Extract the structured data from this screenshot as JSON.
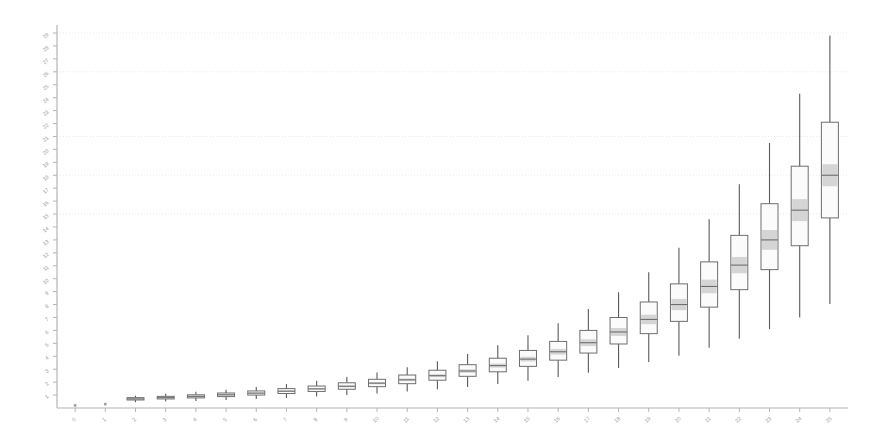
{
  "chart_data": {
    "type": "boxplot",
    "title": "",
    "subtitle": "",
    "xlabel": "",
    "ylabel": "",
    "grid": true,
    "legend": null,
    "background_color": "#ffffff",
    "box_edge_color": "#6e6e6e",
    "box_fill_color": "#fbfbfb",
    "median_band_color": "#b0b0b0",
    "whisker_color": "#5a5a5a",
    "axis_color": "#b4b4b4",
    "grid_color": "#e9e9e9",
    "tick_label_color": "#9a9a9a",
    "xlim": [
      -0.6,
      25.6
    ],
    "ylim": [
      0,
      29
    ],
    "categories": [
      "0",
      "1",
      "2",
      "3",
      "4",
      "5",
      "6",
      "7",
      "8",
      "9",
      "10",
      "11",
      "12",
      "13",
      "14",
      "15",
      "16",
      "17",
      "18",
      "19",
      "20",
      "21",
      "22",
      "23",
      "24",
      "25"
    ],
    "xtick_labels": [
      "0",
      "1",
      "2",
      "3",
      "4",
      "5",
      "6",
      "7",
      "8",
      "9",
      "10",
      "11",
      "12",
      "13",
      "14",
      "15",
      "16",
      "17",
      "18",
      "19",
      "20",
      "21",
      "22",
      "23",
      "24",
      "25"
    ],
    "ytick_labels": [
      "1",
      "2",
      "3",
      "4",
      "5",
      "6",
      "7",
      "8",
      "9",
      "10",
      "11",
      "12",
      "13",
      "14",
      "15",
      "16",
      "17",
      "18",
      "19",
      "20",
      "21",
      "22",
      "23",
      "24",
      "25",
      "26",
      "27",
      "28",
      "29"
    ],
    "ytick_values": [
      1,
      2,
      3,
      4,
      5,
      6,
      7,
      8,
      9,
      10,
      11,
      12,
      13,
      14,
      15,
      16,
      17,
      18,
      19,
      20,
      21,
      22,
      23,
      24,
      25,
      26,
      27,
      28,
      29
    ],
    "gridline_values": [
      29,
      26,
      21,
      18,
      15
    ],
    "boxes": [
      {
        "label": "0",
        "whisker_low": 0.2,
        "q1": 0.2,
        "median": 0.2,
        "q3": 0.2,
        "whisker_high": 0.2
      },
      {
        "label": "1",
        "whisker_low": 0.3,
        "q1": 0.3,
        "median": 0.3,
        "q3": 0.3,
        "whisker_high": 0.3
      },
      {
        "label": "2",
        "whisker_low": 0.45,
        "q1": 0.62,
        "median": 0.7,
        "q3": 0.8,
        "whisker_high": 0.95
      },
      {
        "label": "3",
        "whisker_low": 0.5,
        "q1": 0.7,
        "median": 0.8,
        "q3": 0.9,
        "whisker_high": 1.1
      },
      {
        "label": "4",
        "whisker_low": 0.55,
        "q1": 0.78,
        "median": 0.9,
        "q3": 1.02,
        "whisker_high": 1.25
      },
      {
        "label": "5",
        "whisker_low": 0.62,
        "q1": 0.88,
        "median": 1.02,
        "q3": 1.16,
        "whisker_high": 1.42
      },
      {
        "label": "6",
        "whisker_low": 0.7,
        "q1": 1.0,
        "median": 1.15,
        "q3": 1.32,
        "whisker_high": 1.62
      },
      {
        "label": "7",
        "whisker_low": 0.78,
        "q1": 1.12,
        "median": 1.3,
        "q3": 1.5,
        "whisker_high": 1.85
      },
      {
        "label": "8",
        "whisker_low": 0.88,
        "q1": 1.28,
        "median": 1.48,
        "q3": 1.7,
        "whisker_high": 2.1
      },
      {
        "label": "9",
        "whisker_low": 1.0,
        "q1": 1.45,
        "median": 1.68,
        "q3": 1.95,
        "whisker_high": 2.4
      },
      {
        "label": "10",
        "whisker_low": 1.12,
        "q1": 1.65,
        "median": 1.92,
        "q3": 2.22,
        "whisker_high": 2.75
      },
      {
        "label": "11",
        "whisker_low": 1.28,
        "q1": 1.88,
        "median": 2.18,
        "q3": 2.55,
        "whisker_high": 3.15
      },
      {
        "label": "12",
        "whisker_low": 1.45,
        "q1": 2.15,
        "median": 2.5,
        "q3": 2.92,
        "whisker_high": 3.62
      },
      {
        "label": "13",
        "whisker_low": 1.62,
        "q1": 2.45,
        "median": 2.86,
        "q3": 3.35,
        "whisker_high": 4.18
      },
      {
        "label": "14",
        "whisker_low": 1.85,
        "q1": 2.8,
        "median": 3.28,
        "q3": 3.85,
        "whisker_high": 4.85
      },
      {
        "label": "15",
        "whisker_low": 2.1,
        "q1": 3.22,
        "median": 3.78,
        "q3": 4.45,
        "whisker_high": 5.62
      },
      {
        "label": "16",
        "whisker_low": 2.4,
        "q1": 3.7,
        "median": 4.35,
        "q3": 5.15,
        "whisker_high": 6.55
      },
      {
        "label": "17",
        "whisker_low": 2.72,
        "q1": 4.25,
        "median": 5.05,
        "q3": 6.0,
        "whisker_high": 7.65
      },
      {
        "label": "18",
        "whisker_low": 3.1,
        "q1": 4.95,
        "median": 5.88,
        "q3": 7.0,
        "whisker_high": 8.95
      },
      {
        "label": "19",
        "whisker_low": 3.55,
        "q1": 5.75,
        "median": 6.85,
        "q3": 8.2,
        "whisker_high": 10.5
      },
      {
        "label": "20",
        "whisker_low": 4.05,
        "q1": 6.7,
        "median": 8.0,
        "q3": 9.6,
        "whisker_high": 12.4
      },
      {
        "label": "21",
        "whisker_low": 4.65,
        "q1": 7.8,
        "median": 9.4,
        "q3": 11.3,
        "whisker_high": 14.6
      },
      {
        "label": "22",
        "whisker_low": 5.35,
        "q1": 9.15,
        "median": 11.05,
        "q3": 13.35,
        "whisker_high": 17.3
      },
      {
        "label": "23",
        "whisker_low": 6.1,
        "q1": 10.7,
        "median": 13.0,
        "q3": 15.8,
        "whisker_high": 20.5
      },
      {
        "label": "24",
        "whisker_low": 7.0,
        "q1": 12.55,
        "median": 15.3,
        "q3": 18.7,
        "whisker_high": 24.3
      },
      {
        "label": "25",
        "whisker_low": 8.05,
        "q1": 14.7,
        "median": 18.0,
        "q3": 22.1,
        "whisker_high": 28.8
      }
    ]
  }
}
